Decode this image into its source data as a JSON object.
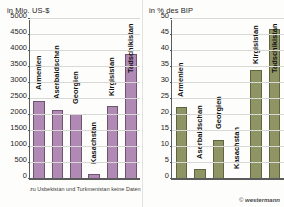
{
  "figure": {
    "footnote": "zu Usbekistan und Turkmenistan keine Daten",
    "credit_mark": "©",
    "credit_text": "westermann"
  },
  "chart_data": [
    {
      "type": "bar",
      "title": "in Mio. US-$",
      "xlabel": "",
      "ylabel": "in Mio. US-$",
      "categories": [
        "Armenien",
        "Aserbaidschan",
        "Georgien",
        "Kasachstan",
        "Kirgisistan",
        "Tadschikistan"
      ],
      "values": [
        2450,
        2170,
        2030,
        150,
        2280,
        3900
      ],
      "ylim": [
        0,
        5000
      ],
      "ytick_step": 500,
      "yticks": [
        "0",
        "500",
        "1000",
        "1500",
        "2000",
        "2500",
        "3000",
        "3500",
        "4000",
        "4500",
        "5000"
      ],
      "ytick_values": [
        0,
        500,
        1000,
        1500,
        2000,
        2500,
        3000,
        3500,
        4000,
        4500,
        5000
      ],
      "grid": true,
      "legend": "none",
      "bar_color": "#b189b5",
      "bar_border": "#6d5570",
      "note": "zu Usbekistan und Turkmenistan keine Daten"
    },
    {
      "type": "bar",
      "title": "in % des BIP",
      "xlabel": "",
      "ylabel": "in % des BIP",
      "categories": [
        "Armenien",
        "Aserbaidschan",
        "Georgien",
        "Kasachstan",
        "Kirgisistan",
        "Tadschikistan"
      ],
      "values": [
        22.5,
        3.0,
        12.3,
        0.0,
        34.0,
        47.0
      ],
      "ylim": [
        0,
        50
      ],
      "ytick_step": 5,
      "yticks": [
        "0",
        "5",
        "10",
        "15",
        "20",
        "25",
        "30",
        "35",
        "40",
        "45",
        "50"
      ],
      "ytick_values": [
        0,
        5,
        10,
        15,
        20,
        25,
        30,
        35,
        40,
        45,
        50
      ],
      "grid": true,
      "legend": "none",
      "bar_color": "#8f9465",
      "bar_border": "#5e6340"
    }
  ]
}
